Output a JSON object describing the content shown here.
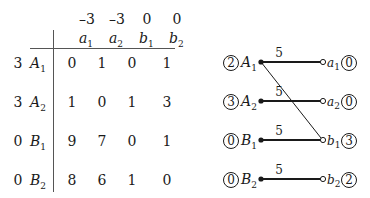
{
  "table": {
    "column_prices": [
      "–3",
      "–3",
      "0",
      "0"
    ],
    "columns": [
      {
        "name": "a",
        "sub": "1"
      },
      {
        "name": "a",
        "sub": "2"
      },
      {
        "name": "b",
        "sub": "1"
      },
      {
        "name": "b",
        "sub": "2"
      }
    ],
    "rows": [
      {
        "price": "3",
        "name": "A",
        "sub": "1",
        "values": [
          "0",
          "1",
          "0",
          "1"
        ]
      },
      {
        "price": "3",
        "name": "A",
        "sub": "2",
        "values": [
          "1",
          "0",
          "1",
          "3"
        ]
      },
      {
        "price": "0",
        "name": "B",
        "sub": "1",
        "values": [
          "9",
          "7",
          "0",
          "1"
        ]
      },
      {
        "price": "0",
        "name": "B",
        "sub": "2",
        "values": [
          "8",
          "6",
          "1",
          "0"
        ]
      }
    ]
  },
  "graph": {
    "left_nodes": [
      {
        "circled": "2",
        "name": "A",
        "sub": "1"
      },
      {
        "circled": "3",
        "name": "A",
        "sub": "2"
      },
      {
        "circled": "0",
        "name": "B",
        "sub": "1"
      },
      {
        "circled": "0",
        "name": "B",
        "sub": "2"
      }
    ],
    "right_nodes": [
      {
        "circled": "0",
        "name": "a",
        "sub": "1"
      },
      {
        "circled": "0",
        "name": "a",
        "sub": "2"
      },
      {
        "circled": "3",
        "name": "b",
        "sub": "1"
      },
      {
        "circled": "2",
        "name": "b",
        "sub": "2"
      }
    ],
    "edge_labels": [
      "5",
      "5",
      "5",
      "5"
    ],
    "thin_edges": [
      {
        "from": "A1",
        "to": "b1"
      }
    ]
  }
}
